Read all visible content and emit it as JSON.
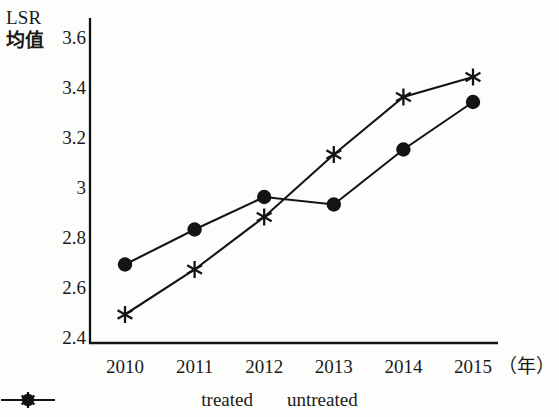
{
  "chart_data": {
    "type": "line",
    "title": "",
    "ylabel": "LSR 均值",
    "ylabel_line1": "LSR",
    "ylabel_line2": "均值",
    "xlabel": "（年）",
    "categories": [
      "2010",
      "2011",
      "2012",
      "2013",
      "2014",
      "2015"
    ],
    "x": [
      2010,
      2011,
      2012,
      2013,
      2014,
      2015
    ],
    "series": [
      {
        "name": "treated",
        "marker": "asterisk",
        "color": "#141414",
        "values": [
          2.49,
          2.67,
          2.88,
          3.13,
          3.36,
          3.44
        ]
      },
      {
        "name": "untreated",
        "marker": "circle",
        "color": "#141414",
        "values": [
          2.69,
          2.83,
          2.96,
          2.93,
          3.15,
          3.34
        ]
      }
    ],
    "yticks": [
      "2.4",
      "2.6",
      "2.8",
      "3",
      "3.2",
      "3.4",
      "3.6"
    ],
    "ytick_values": [
      2.4,
      2.6,
      2.8,
      3.0,
      3.2,
      3.4,
      3.6
    ],
    "ylim": [
      2.4,
      3.6
    ],
    "xlim": [
      2009.5,
      2015.5
    ],
    "grid": false,
    "legend_position": "bottom-center"
  },
  "legend": {
    "items": [
      {
        "label": "treated",
        "marker": "asterisk-icon"
      },
      {
        "label": "untreated",
        "marker": "circle-icon"
      }
    ]
  },
  "axes": {
    "y_label_line1": "LSR",
    "y_label_line2": "均值",
    "x_unit": "（年）"
  }
}
